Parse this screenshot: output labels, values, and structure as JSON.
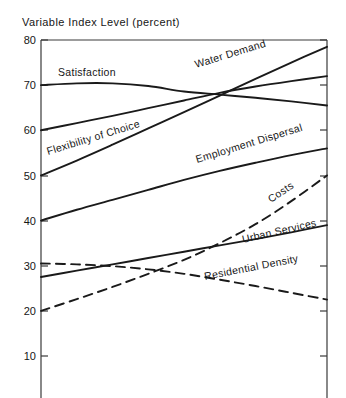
{
  "chart_data": {
    "type": "line",
    "title": "Variable Index Level (percent)",
    "xlabel": "",
    "ylabel": "Variable Index Level (percent)",
    "ylim": [
      0,
      80
    ],
    "yticks": [
      80,
      70,
      60,
      50,
      40,
      30,
      20,
      10
    ],
    "ytick_labels": [
      "80",
      "70",
      "60",
      "50",
      "40",
      "30",
      "20",
      "10"
    ],
    "xlim": [
      0,
      100
    ],
    "grid": false,
    "legend": "inline-curve-labels",
    "series": [
      {
        "name": "Water Demand",
        "linestyle": "solid",
        "label_angle_deg": -17,
        "x": [
          0,
          12.5,
          25,
          37.5,
          50,
          62.5,
          75,
          87.5,
          100
        ],
        "values": [
          50.0,
          53.3,
          56.8,
          60.4,
          64.0,
          67.7,
          71.4,
          75.0,
          78.5
        ]
      },
      {
        "name": "Flexibility of Choice",
        "linestyle": "solid",
        "label_angle_deg": -17,
        "x": [
          0,
          12.5,
          25,
          37.5,
          50,
          62.5,
          75,
          87.5,
          100
        ],
        "values": [
          60.0,
          61.6,
          63.2,
          64.9,
          66.6,
          68.3,
          69.7,
          70.9,
          72.0
        ]
      },
      {
        "name": "Satisfaction",
        "linestyle": "solid",
        "label_angle_deg": 0,
        "x": [
          0,
          12.5,
          25,
          37.5,
          50,
          62.5,
          75,
          87.5,
          100
        ],
        "values": [
          70.0,
          70.4,
          70.4,
          69.8,
          68.6,
          67.9,
          67.2,
          66.4,
          65.5
        ]
      },
      {
        "name": "Employment Dispersal",
        "linestyle": "solid",
        "label_angle_deg": -17,
        "x": [
          0,
          12.5,
          25,
          37.5,
          50,
          62.5,
          75,
          87.5,
          100
        ],
        "values": [
          40.0,
          42.4,
          44.6,
          46.8,
          49.0,
          51.0,
          52.8,
          54.5,
          56.0
        ]
      },
      {
        "name": "Costs",
        "linestyle": "dashed",
        "label_angle_deg": -33,
        "x": [
          0,
          12.5,
          25,
          37.5,
          50,
          62.5,
          75,
          87.5,
          100
        ],
        "values": [
          20.0,
          22.6,
          25.3,
          28.2,
          31.3,
          35.0,
          39.2,
          44.3,
          50.0
        ]
      },
      {
        "name": "Urban Services",
        "linestyle": "solid",
        "label_angle_deg": -13,
        "x": [
          0,
          12.5,
          25,
          37.5,
          50,
          62.5,
          75,
          87.5,
          100
        ],
        "values": [
          27.5,
          28.9,
          30.3,
          31.7,
          33.1,
          34.5,
          35.9,
          37.4,
          39.0
        ]
      },
      {
        "name": "Residential Density",
        "linestyle": "dashed",
        "label_angle_deg": -11,
        "x": [
          0,
          12.5,
          25,
          37.5,
          50,
          62.5,
          75,
          87.5,
          100
        ],
        "values": [
          30.5,
          30.3,
          29.9,
          29.2,
          28.2,
          26.9,
          25.5,
          24.0,
          22.5
        ]
      }
    ]
  },
  "axis": {
    "title": "Variable Index Level (percent)",
    "ticks": [
      {
        "label": "80"
      },
      {
        "label": "70"
      },
      {
        "label": "60"
      },
      {
        "label": "50"
      },
      {
        "label": "40"
      },
      {
        "label": "30"
      },
      {
        "label": "20"
      },
      {
        "label": "10"
      }
    ]
  },
  "labels": {
    "satisfaction": "Satisfaction",
    "water_demand": "Water Demand",
    "flexibility_of_choice": "Flexibility of Choice",
    "employment_dispersal": "Employment Dispersal",
    "costs": "Costs",
    "urban_services": "Urban Services",
    "residential_density": "Residential Density"
  }
}
